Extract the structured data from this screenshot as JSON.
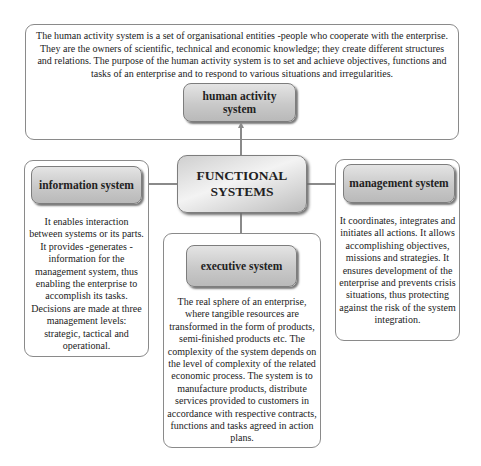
{
  "center": {
    "line1": "FUNCTIONAL",
    "line2": "SYSTEMS"
  },
  "human_activity": {
    "label_line1": "human activity",
    "label_line2": "system",
    "description": "The human activity system is a set of organisational entities -people who cooperate with the enterprise. They are the owners of scientific, technical and economic knowledge; they create different structures and relations. The purpose of the human activity system is to set and achieve objectives, functions and tasks of an enterprise and to respond to various situations and irregularities."
  },
  "information": {
    "label": "information system",
    "description": "It enables interaction between systems or its parts. It provides -generates - information for the management system, thus enabling the enterprise to accomplish its tasks. Decisions are made at three management levels: strategic, tactical and operational."
  },
  "management": {
    "label": "management system",
    "description": "It coordinates, integrates and initiates all actions. It allows accomplishing objectives, missions and strategies. It ensures development of the enterprise and prevents crisis situations, thus protecting against the risk of the system integration."
  },
  "executive": {
    "label": "executive system",
    "description": "The real sphere of an enterprise, where tangible resources are transformed in the form of products, semi-finished products etc. The complexity of the system depends on the level of complexity of the related economic process. The system is to manufacture products, distribute services provided to customers in accordance with respective contracts, functions and tasks agreed in action plans."
  },
  "colors": {
    "border": "#8a8a8a",
    "label_fill": "#c9c9c9",
    "text": "#222222"
  }
}
